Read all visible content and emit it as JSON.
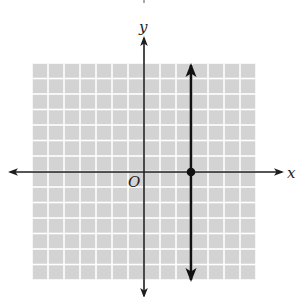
{
  "chart_data": {
    "type": "line",
    "title": "",
    "xlabel": "x",
    "ylabel": "y",
    "origin_label": "O",
    "xlim": [
      -7,
      7
    ],
    "ylim": [
      -7,
      7
    ],
    "grid": true,
    "tick_labels": false,
    "series": [
      {
        "name": "x = 3",
        "kind": "vertical-line",
        "x": 3,
        "arrows": "both",
        "y_range": [
          -7,
          7
        ]
      }
    ],
    "points": [
      {
        "label": "x-intercept",
        "x": 3,
        "y": 0,
        "filled": true
      }
    ]
  },
  "labels": {
    "x_axis": "x",
    "y_axis": "y",
    "origin": "O"
  },
  "colors": {
    "grid_cell": "#d3d3d3",
    "grid_line": "#ffffff",
    "axis": "#1e1e1e",
    "line": "#111111"
  }
}
